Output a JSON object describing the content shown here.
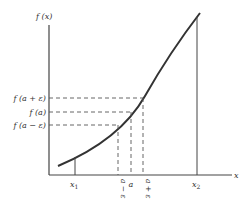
{
  "diagram": {
    "y_axis_label": "f (x)",
    "x_axis_label": "x",
    "y_labels": {
      "f_a_plus_eps": "f (a + ε)",
      "f_a": "f (a)",
      "f_a_minus_eps": "f (a − ε)"
    },
    "x_labels": {
      "x1": "x",
      "x1_sub": "1",
      "x2": "x",
      "x2_sub": "2",
      "a_minus_eps": "a − ε",
      "a": "a",
      "a_plus_eps": "a + ε"
    },
    "colors": {
      "ink": "#333333",
      "dashed": "#555555",
      "background": "#ffffff"
    }
  }
}
